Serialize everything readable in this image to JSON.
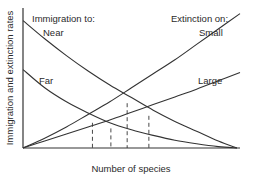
{
  "chart_data": {
    "type": "line",
    "title": "",
    "xlabel": "Number of species",
    "ylabel": "Immigration and extinction rates",
    "xlim": [
      0,
      100
    ],
    "ylim": [
      0,
      100
    ],
    "grid": false,
    "legend_headers": {
      "immigration": "Immigration to:",
      "extinction": "Extinction on:"
    },
    "series": [
      {
        "name": "Near",
        "group": "immigration",
        "label_pos": "upper-left",
        "x": [
          0,
          10,
          20,
          30,
          40,
          50,
          60,
          70,
          80,
          90,
          98.6
        ],
        "y": [
          91,
          78,
          66,
          55,
          45,
          36,
          27,
          19,
          12,
          5,
          0
        ]
      },
      {
        "name": "Far",
        "group": "immigration",
        "label_pos": "middle-left",
        "x": [
          0,
          10,
          20,
          30,
          40,
          50,
          60,
          70,
          80,
          90,
          98.6
        ],
        "y": [
          56,
          43,
          33,
          25,
          18,
          13,
          9,
          5.5,
          3,
          1,
          0
        ]
      },
      {
        "name": "Small",
        "group": "extinction",
        "label_pos": "upper-right",
        "x": [
          0,
          10,
          20,
          30,
          40,
          50,
          60,
          70,
          80,
          90,
          100
        ],
        "y": [
          0,
          7,
          15,
          24,
          33,
          43,
          53,
          63,
          74,
          85,
          96
        ]
      },
      {
        "name": "Large",
        "group": "extinction",
        "label_pos": "middle-right",
        "x": [
          0,
          10,
          20,
          30,
          40,
          50,
          60,
          70,
          80,
          90,
          100
        ],
        "y": [
          0,
          5,
          10,
          15,
          20,
          25.5,
          31,
          36.5,
          42,
          48,
          54
        ]
      }
    ],
    "equilibria": [
      {
        "name": "Far-Small",
        "x": 32,
        "y": 18
      },
      {
        "name": "Far-Large",
        "x": 40.5,
        "y": 14
      },
      {
        "name": "Near-Small",
        "x": 48,
        "y": 32
      },
      {
        "name": "Near-Large",
        "x": 58,
        "y": 23
      }
    ]
  }
}
